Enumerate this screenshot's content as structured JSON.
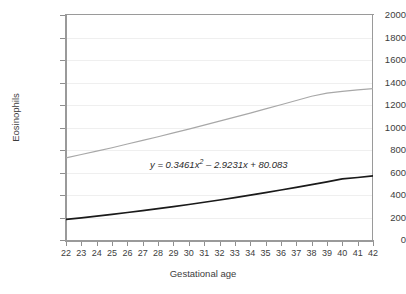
{
  "chart_data": {
    "type": "line",
    "title": "",
    "xlabel": "Gestational age",
    "ylabel": "Eosinophils",
    "xlim": [
      22,
      42
    ],
    "ylim": [
      0,
      2000
    ],
    "ytick_step": 200,
    "xtick_step": 1,
    "grid": true,
    "legend": "none",
    "annotations": [
      {
        "name": "trendline-equation",
        "text_plain": "y = 0.3461x 2 – 2.9231x + 80.083",
        "lhs": "y",
        "equals": "=",
        "term1_coef": "0.3461",
        "term1_var": "x",
        "term1_exp": "2",
        "term2_sign": "–",
        "term2_coef": "2.9231",
        "term2_var": "x",
        "term3_sign": "+",
        "term3_value": "80.083"
      }
    ],
    "x": [
      22,
      23,
      24,
      25,
      26,
      27,
      28,
      29,
      30,
      31,
      32,
      33,
      34,
      35,
      36,
      37,
      38,
      39,
      40,
      41,
      42
    ],
    "series": [
      {
        "name": "upper-trend",
        "color": "#a8a8a8",
        "width": 1.2,
        "values": [
          730,
          760,
          790,
          820,
          853,
          885,
          918,
          952,
          986,
          1021,
          1056,
          1092,
          1128,
          1165,
          1202,
          1240,
          1278,
          1305,
          1322,
          1335,
          1345
        ]
      },
      {
        "name": "lower-trend",
        "color": "#1a1a1a",
        "width": 1.6,
        "values": [
          183,
          197,
          212,
          228,
          244,
          261,
          279,
          297,
          316,
          336,
          356,
          377,
          399,
          421,
          444,
          468,
          492,
          517,
          543,
          556,
          570
        ]
      }
    ],
    "ytick_labels": [
      "2000",
      "1800",
      "1600",
      "1400",
      "1200",
      "1000",
      "800",
      "600",
      "400",
      "200",
      "0"
    ],
    "xtick_labels": [
      "22",
      "23",
      "24",
      "25",
      "26",
      "27",
      "28",
      "29",
      "30",
      "31",
      "32",
      "33",
      "34",
      "35",
      "36",
      "37",
      "38",
      "39",
      "40",
      "41",
      "42"
    ]
  },
  "style": {
    "axis_color": "#9a9a9a",
    "grid_color": "#efefef",
    "text_color": "#3d3d3d",
    "background": "#ffffff"
  }
}
